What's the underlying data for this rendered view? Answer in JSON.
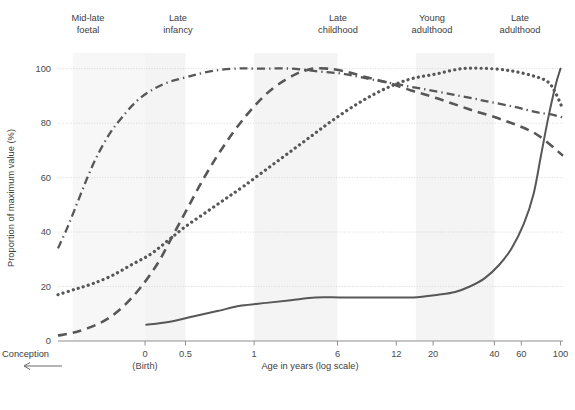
{
  "chart_data": {
    "type": "line",
    "title": "",
    "xlabel": "Age in years (log scale)",
    "ylabel": "Proportion of maximum value (%)",
    "ylim": [
      0,
      105
    ],
    "yticks": [
      0,
      20,
      40,
      60,
      80,
      100
    ],
    "xticks": [
      "0",
      "0.5",
      "1",
      "6",
      "12",
      "20",
      "40",
      "60",
      "100"
    ],
    "xtick_note": "(Birth)",
    "pre_birth_label": "Conception",
    "grid": true,
    "grid_axis": "y",
    "legend_position": "bottom",
    "accent_color": "#575757",
    "grid_color": "#cfcfcf",
    "band_color": "#f4f4f4",
    "stage_bands": [
      {
        "label": "Mid-late\nfoetal",
        "line1": "Mid-late",
        "line2": "foetal"
      },
      {
        "label": "Late\ninfancy",
        "line1": "Late",
        "line2": "infancy"
      },
      {
        "label": "Late\nchildhood",
        "line1": "Late",
        "line2": "childhood"
      },
      {
        "label": "Young\nadulthood",
        "line1": "Young",
        "line2": "adulthood"
      },
      {
        "label": "Late\nadulthood",
        "line1": "Late",
        "line2": "adulthood"
      }
    ],
    "series": [
      {
        "name": "Grey-matter volume",
        "style": "dashed",
        "points": [
          [
            0.0,
            2
          ],
          [
            0.06,
            3
          ],
          [
            0.13,
            5
          ],
          [
            0.2,
            8
          ],
          [
            0.27,
            13
          ],
          [
            0.34,
            20
          ],
          [
            0.41,
            29
          ],
          [
            0.47,
            39
          ],
          [
            0.53,
            49
          ],
          [
            0.59,
            59
          ],
          [
            0.65,
            68
          ],
          [
            0.71,
            76
          ],
          [
            0.77,
            83
          ],
          [
            0.83,
            89
          ],
          [
            0.88,
            93
          ],
          [
            0.93,
            96
          ],
          [
            0.97,
            98
          ],
          [
            1.0,
            99
          ],
          [
            1.04,
            100
          ],
          [
            1.1,
            100
          ],
          [
            1.17,
            99
          ],
          [
            1.25,
            97
          ],
          [
            1.34,
            95
          ],
          [
            1.44,
            92
          ],
          [
            1.55,
            89
          ],
          [
            1.68,
            85
          ],
          [
            1.82,
            81
          ],
          [
            1.95,
            76
          ],
          [
            2.06,
            68
          ]
        ]
      },
      {
        "name": "White-matter volume",
        "style": "dotted",
        "points": [
          [
            0.0,
            17
          ],
          [
            0.07,
            19
          ],
          [
            0.14,
            21
          ],
          [
            0.22,
            24
          ],
          [
            0.3,
            28
          ],
          [
            0.38,
            32
          ],
          [
            0.45,
            37
          ],
          [
            0.52,
            42
          ],
          [
            0.6,
            47
          ],
          [
            0.68,
            52
          ],
          [
            0.76,
            57
          ],
          [
            0.85,
            63
          ],
          [
            0.94,
            69
          ],
          [
            1.03,
            75
          ],
          [
            1.12,
            81
          ],
          [
            1.22,
            87
          ],
          [
            1.32,
            92
          ],
          [
            1.43,
            96
          ],
          [
            1.54,
            98
          ],
          [
            1.65,
            100
          ],
          [
            1.76,
            100
          ],
          [
            1.86,
            99
          ],
          [
            1.95,
            97
          ],
          [
            2.0,
            95
          ],
          [
            2.03,
            91
          ],
          [
            2.06,
            85
          ]
        ]
      },
      {
        "name": "Ventricular volume",
        "style": "solid",
        "points": [
          [
            0.36,
            6
          ],
          [
            0.45,
            7
          ],
          [
            0.55,
            9
          ],
          [
            0.65,
            11
          ],
          [
            0.75,
            13
          ],
          [
            0.85,
            14
          ],
          [
            0.95,
            15
          ],
          [
            1.05,
            16
          ],
          [
            1.15,
            16
          ],
          [
            1.25,
            16
          ],
          [
            1.35,
            16
          ],
          [
            1.45,
            16
          ],
          [
            1.55,
            17
          ],
          [
            1.62,
            18
          ],
          [
            1.68,
            20
          ],
          [
            1.74,
            23
          ],
          [
            1.8,
            28
          ],
          [
            1.85,
            34
          ],
          [
            1.9,
            43
          ],
          [
            1.94,
            54
          ],
          [
            1.97,
            68
          ],
          [
            2.0,
            82
          ],
          [
            2.03,
            94
          ],
          [
            2.05,
            100
          ]
        ]
      },
      {
        "name": "Cortical thickness",
        "style": "dashdot",
        "points": [
          [
            0.0,
            34
          ],
          [
            0.04,
            42
          ],
          [
            0.08,
            51
          ],
          [
            0.12,
            60
          ],
          [
            0.16,
            68
          ],
          [
            0.21,
            76
          ],
          [
            0.26,
            82
          ],
          [
            0.32,
            88
          ],
          [
            0.38,
            92
          ],
          [
            0.45,
            95
          ],
          [
            0.53,
            97
          ],
          [
            0.62,
            99
          ],
          [
            0.72,
            100
          ],
          [
            0.83,
            100
          ],
          [
            0.95,
            100
          ],
          [
            1.06,
            99
          ],
          [
            1.17,
            98
          ],
          [
            1.28,
            96
          ],
          [
            1.4,
            94
          ],
          [
            1.52,
            92
          ],
          [
            1.64,
            90
          ],
          [
            1.75,
            88
          ],
          [
            1.86,
            86
          ],
          [
            1.95,
            84
          ],
          [
            2.02,
            83
          ],
          [
            2.06,
            82
          ]
        ]
      }
    ]
  },
  "legend": {
    "items": [
      {
        "label": "Grey-matter volume",
        "style": "dashed"
      },
      {
        "label": "White-matter volume",
        "style": "dotted"
      },
      {
        "label": "Ventricular volume",
        "style": "solid"
      },
      {
        "label": "Cortical thickness",
        "style": "dashdot"
      }
    ]
  }
}
